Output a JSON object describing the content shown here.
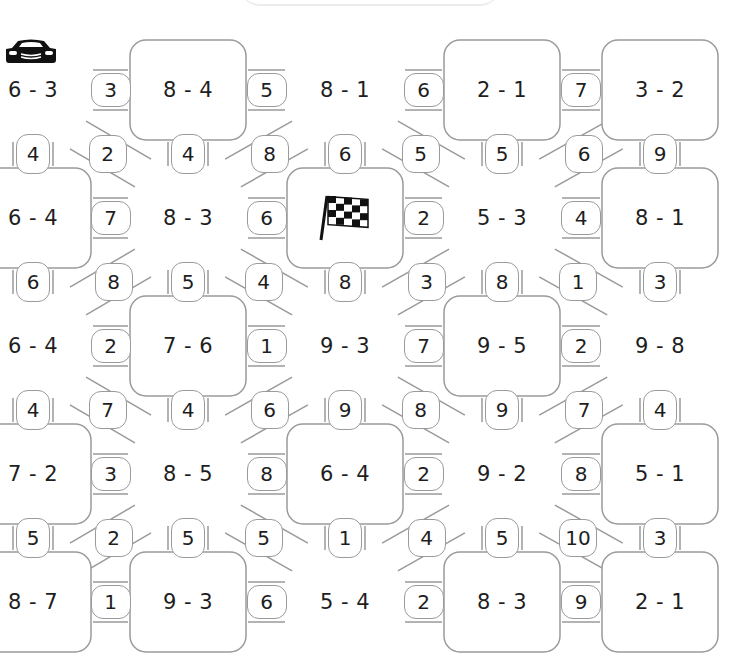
{
  "puzzle": {
    "type": "subtraction-maze",
    "start_icon": "race-car-icon",
    "finish_icon": "checkered-flag-icon",
    "columns_x": [
      33,
      188,
      345,
      502,
      660
    ],
    "rows_y": [
      90,
      218,
      346,
      474,
      602
    ],
    "nodes": [
      {
        "r": 0,
        "c": 0,
        "label": "6 - 3",
        "shape": "hub"
      },
      {
        "r": 0,
        "c": 1,
        "label": "8 - 4",
        "shape": "box"
      },
      {
        "r": 0,
        "c": 2,
        "label": "8 - 1",
        "shape": "hub"
      },
      {
        "r": 0,
        "c": 3,
        "label": "2 - 1",
        "shape": "box"
      },
      {
        "r": 0,
        "c": 4,
        "label": "3 - 2",
        "shape": "box"
      },
      {
        "r": 1,
        "c": 0,
        "label": "6 - 4",
        "shape": "box"
      },
      {
        "r": 1,
        "c": 1,
        "label": "8 - 3",
        "shape": "hub"
      },
      {
        "r": 1,
        "c": 2,
        "label": "",
        "shape": "box",
        "icon": "checkered-flag-icon"
      },
      {
        "r": 1,
        "c": 3,
        "label": "5 - 3",
        "shape": "hub"
      },
      {
        "r": 1,
        "c": 4,
        "label": "8 - 1",
        "shape": "box"
      },
      {
        "r": 2,
        "c": 0,
        "label": "6 - 4",
        "shape": "hub"
      },
      {
        "r": 2,
        "c": 1,
        "label": "7 - 6",
        "shape": "box"
      },
      {
        "r": 2,
        "c": 2,
        "label": "9 - 3",
        "shape": "hub"
      },
      {
        "r": 2,
        "c": 3,
        "label": "9 - 5",
        "shape": "box"
      },
      {
        "r": 2,
        "c": 4,
        "label": "9 - 8",
        "shape": "hub"
      },
      {
        "r": 3,
        "c": 0,
        "label": "7 - 2",
        "shape": "box"
      },
      {
        "r": 3,
        "c": 1,
        "label": "8 - 5",
        "shape": "hub"
      },
      {
        "r": 3,
        "c": 2,
        "label": "6 - 4",
        "shape": "box"
      },
      {
        "r": 3,
        "c": 3,
        "label": "9 - 2",
        "shape": "hub"
      },
      {
        "r": 3,
        "c": 4,
        "label": "5 - 1",
        "shape": "box"
      },
      {
        "r": 4,
        "c": 0,
        "label": "8 - 7",
        "shape": "box"
      },
      {
        "r": 4,
        "c": 1,
        "label": "9 - 3",
        "shape": "box"
      },
      {
        "r": 4,
        "c": 2,
        "label": "5 - 4",
        "shape": "hub"
      },
      {
        "r": 4,
        "c": 3,
        "label": "8 - 3",
        "shape": "box"
      },
      {
        "r": 4,
        "c": 4,
        "label": "2 - 1",
        "shape": "box"
      }
    ],
    "horizontal_badges": [
      {
        "r": 0,
        "c": 0,
        "value": "3"
      },
      {
        "r": 0,
        "c": 1,
        "value": "5"
      },
      {
        "r": 0,
        "c": 2,
        "value": "6"
      },
      {
        "r": 0,
        "c": 3,
        "value": "7"
      },
      {
        "r": 1,
        "c": 0,
        "value": "7"
      },
      {
        "r": 1,
        "c": 1,
        "value": "6"
      },
      {
        "r": 1,
        "c": 2,
        "value": "2"
      },
      {
        "r": 1,
        "c": 3,
        "value": "4"
      },
      {
        "r": 2,
        "c": 0,
        "value": "2"
      },
      {
        "r": 2,
        "c": 1,
        "value": "1"
      },
      {
        "r": 2,
        "c": 2,
        "value": "7"
      },
      {
        "r": 2,
        "c": 3,
        "value": "2"
      },
      {
        "r": 3,
        "c": 0,
        "value": "3"
      },
      {
        "r": 3,
        "c": 1,
        "value": "8"
      },
      {
        "r": 3,
        "c": 2,
        "value": "2"
      },
      {
        "r": 3,
        "c": 3,
        "value": "8"
      },
      {
        "r": 4,
        "c": 0,
        "value": "1"
      },
      {
        "r": 4,
        "c": 1,
        "value": "6"
      },
      {
        "r": 4,
        "c": 2,
        "value": "2"
      },
      {
        "r": 4,
        "c": 3,
        "value": "9"
      }
    ],
    "vertical_badges": [
      {
        "r": 0,
        "c": 0,
        "value": "4"
      },
      {
        "r": 0,
        "c": 1,
        "value": "4"
      },
      {
        "r": 0,
        "c": 2,
        "value": "6"
      },
      {
        "r": 0,
        "c": 3,
        "value": "5"
      },
      {
        "r": 0,
        "c": 4,
        "value": "9"
      },
      {
        "r": 1,
        "c": 0,
        "value": "6"
      },
      {
        "r": 1,
        "c": 1,
        "value": "5"
      },
      {
        "r": 1,
        "c": 2,
        "value": "8"
      },
      {
        "r": 1,
        "c": 3,
        "value": "8"
      },
      {
        "r": 1,
        "c": 4,
        "value": "3"
      },
      {
        "r": 2,
        "c": 0,
        "value": "4"
      },
      {
        "r": 2,
        "c": 1,
        "value": "4"
      },
      {
        "r": 2,
        "c": 2,
        "value": "9"
      },
      {
        "r": 2,
        "c": 3,
        "value": "9"
      },
      {
        "r": 2,
        "c": 4,
        "value": "4"
      },
      {
        "r": 3,
        "c": 0,
        "value": "5"
      },
      {
        "r": 3,
        "c": 1,
        "value": "5"
      },
      {
        "r": 3,
        "c": 2,
        "value": "1"
      },
      {
        "r": 3,
        "c": 3,
        "value": "5"
      },
      {
        "r": 3,
        "c": 4,
        "value": "3"
      }
    ],
    "diagonal_badges": [
      {
        "r": 0,
        "c": 0,
        "dir": "down-right",
        "value": "2"
      },
      {
        "r": 0,
        "c": 1,
        "dir": "down-left",
        "value": "8"
      },
      {
        "r": 0,
        "c": 2,
        "dir": "down-right",
        "value": "5"
      },
      {
        "r": 0,
        "c": 3,
        "dir": "down-left",
        "value": "6"
      },
      {
        "r": 1,
        "c": 0,
        "dir": "down-left",
        "value": "8"
      },
      {
        "r": 1,
        "c": 1,
        "dir": "down-right",
        "value": "4"
      },
      {
        "r": 1,
        "c": 2,
        "dir": "down-left",
        "value": "3"
      },
      {
        "r": 1,
        "c": 3,
        "dir": "down-right",
        "value": "1"
      },
      {
        "r": 2,
        "c": 0,
        "dir": "down-right",
        "value": "7"
      },
      {
        "r": 2,
        "c": 1,
        "dir": "down-left",
        "value": "6"
      },
      {
        "r": 2,
        "c": 2,
        "dir": "down-right",
        "value": "8"
      },
      {
        "r": 2,
        "c": 3,
        "dir": "down-left",
        "value": "7"
      },
      {
        "r": 3,
        "c": 0,
        "dir": "down-left",
        "value": "2"
      },
      {
        "r": 3,
        "c": 1,
        "dir": "down-right",
        "value": "5"
      },
      {
        "r": 3,
        "c": 2,
        "dir": "down-left",
        "value": "4"
      },
      {
        "r": 3,
        "c": 3,
        "dir": "down-right",
        "value": "10"
      }
    ]
  },
  "colors": {
    "stroke": "#9a9a9a",
    "text": "#1e1e1e",
    "background": "#ffffff",
    "icon": "#111111"
  }
}
